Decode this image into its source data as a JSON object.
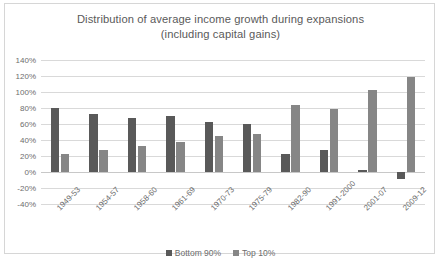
{
  "chart_data": {
    "type": "bar",
    "title": "Distribution of average income growth during expansions (including capital gains)",
    "title_line1": "Distribution of average income growth during expansions",
    "title_line2": "(including capital gains)",
    "xlabel": "",
    "ylabel": "",
    "ylim": [
      -40,
      140
    ],
    "ytick_step": 20,
    "ytick_labels": [
      "140%",
      "120%",
      "100%",
      "80%",
      "60%",
      "40%",
      "20%",
      "0%",
      "-20%",
      "-40%"
    ],
    "ytick_values": [
      140,
      120,
      100,
      80,
      60,
      40,
      20,
      0,
      -20,
      -40
    ],
    "grid": true,
    "legend_position": "bottom",
    "categories": [
      "1949-53",
      "1954-57",
      "1958-60",
      "1961-69",
      "1970-73",
      "1975-79",
      "1982-90",
      "1991-2000",
      "2001-07",
      "2009-12"
    ],
    "series": [
      {
        "name": "Bottom 90%",
        "color": "#595959",
        "values": [
          80,
          72,
          68,
          70,
          62,
          60,
          22,
          28,
          2,
          -9
        ]
      },
      {
        "name": "Top 10%",
        "color": "#868686",
        "values": [
          22,
          27,
          33,
          37,
          45,
          47,
          84,
          79,
          103,
          119
        ]
      }
    ]
  },
  "legend": {
    "items": [
      {
        "label": "Bottom 90%",
        "color": "#595959"
      },
      {
        "label": "Top 10%",
        "color": "#868686"
      }
    ]
  },
  "colors": {
    "background": "#ffffff",
    "frame_border": "#d6d6d6",
    "gridline": "#d9d9d9",
    "text": "#6d6d6d",
    "title_text": "#5a5a5a"
  }
}
